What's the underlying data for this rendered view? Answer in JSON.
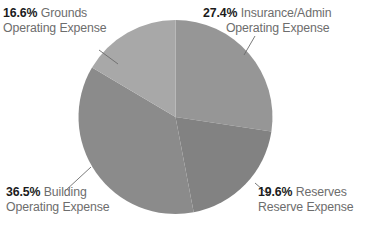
{
  "chart_data": {
    "type": "pie",
    "title": "",
    "xlabel": "",
    "ylabel": "",
    "legend_position": "none",
    "grid": false,
    "categories": [
      "Insurance/Admin Operating Expense",
      "Reserves Reserve Expense",
      "Building Operating Expense",
      "Grounds Operating Expense"
    ],
    "values": [
      27.4,
      19.6,
      36.5,
      16.6
    ],
    "unit": "%",
    "slices": [
      {
        "id": "insurance",
        "percent_label": "27.4%",
        "value": 27.4,
        "name_line1": "Insurance/Admin",
        "name_line2": "Operating Expense",
        "color": "#969696",
        "start_deg": 0,
        "end_deg": 98.64
      },
      {
        "id": "reserves",
        "percent_label": "19.6%",
        "value": 19.6,
        "name_line1": "Reserves",
        "name_line2": "Reserve Expense",
        "color": "#828282",
        "start_deg": 98.64,
        "end_deg": 169.2
      },
      {
        "id": "building",
        "percent_label": "36.5%",
        "value": 36.5,
        "name_line1": "Building",
        "name_line2": "Operating Expense",
        "color": "#8b8b8b",
        "start_deg": 169.2,
        "end_deg": 300.6
      },
      {
        "id": "grounds",
        "percent_label": "16.6%",
        "value": 16.6,
        "name_line1": "Grounds",
        "name_line2": "Operating Expense",
        "color": "#a8a8a8",
        "start_deg": 300.6,
        "end_deg": 360
      }
    ]
  },
  "colors": {
    "background": "#ffffff",
    "percent_text": "#1b1b1b",
    "name_text": "#6d6d6d",
    "leader_line": "#6b6b6b"
  }
}
